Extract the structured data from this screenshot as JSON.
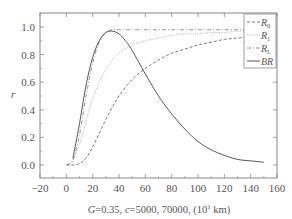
{
  "chart_data": {
    "type": "line",
    "title": "",
    "xlabel": "G=0.35, c=5000, 70000, (10¹ km)",
    "ylabel": "r",
    "xlim": [
      -20,
      160
    ],
    "ylim": [
      -0.1,
      1.1
    ],
    "x_ticks": [
      -20,
      0,
      20,
      40,
      60,
      80,
      100,
      120,
      140,
      160
    ],
    "y_ticks": [
      0.0,
      0.2,
      0.4,
      0.6,
      0.8,
      1.0
    ],
    "grid": false,
    "legend_position": "top-right",
    "series": [
      {
        "name": "R0",
        "label_main": "R",
        "label_sub": "0",
        "style": "dashed",
        "x": [
          0,
          5,
          10,
          15,
          20,
          25,
          30,
          35,
          40,
          50,
          60,
          70,
          80,
          90,
          100,
          110,
          120,
          130,
          140,
          150
        ],
        "values": [
          0.0,
          0.0,
          0.01,
          0.05,
          0.13,
          0.23,
          0.33,
          0.42,
          0.5,
          0.62,
          0.7,
          0.76,
          0.81,
          0.84,
          0.87,
          0.89,
          0.91,
          0.92,
          0.93,
          0.94
        ]
      },
      {
        "name": "R1",
        "label_main": "R",
        "label_sub": "1",
        "style": "dotted",
        "x": [
          2,
          5,
          10,
          15,
          20,
          25,
          30,
          35,
          40,
          50,
          60,
          70,
          80,
          90,
          100,
          110,
          120,
          130,
          140,
          150
        ],
        "values": [
          0.0,
          0.03,
          0.15,
          0.32,
          0.48,
          0.6,
          0.69,
          0.76,
          0.81,
          0.87,
          0.9,
          0.92,
          0.94,
          0.95,
          0.95,
          0.96,
          0.96,
          0.97,
          0.97,
          0.97
        ]
      },
      {
        "name": "RL",
        "label_main": "R",
        "label_sub": "L",
        "style": "dash-dot",
        "x": [
          0,
          5,
          10,
          15,
          20,
          25,
          30,
          35,
          40,
          50,
          60,
          80,
          100,
          120,
          150
        ],
        "values": [
          0.0,
          0.04,
          0.22,
          0.5,
          0.74,
          0.89,
          0.96,
          0.98,
          0.98,
          0.98,
          0.98,
          0.98,
          0.98,
          0.98,
          0.98
        ]
      },
      {
        "name": "BR",
        "label_main": "BR",
        "label_sub": "",
        "style": "solid",
        "x": [
          5,
          10,
          15,
          20,
          25,
          30,
          35,
          40,
          45,
          50,
          60,
          70,
          80,
          90,
          100,
          110,
          120,
          130,
          140,
          150
        ],
        "values": [
          0.05,
          0.3,
          0.58,
          0.78,
          0.9,
          0.96,
          0.97,
          0.95,
          0.9,
          0.83,
          0.66,
          0.5,
          0.37,
          0.26,
          0.17,
          0.11,
          0.07,
          0.04,
          0.03,
          0.02
        ]
      }
    ]
  },
  "legend": {
    "items": [
      {
        "main": "R",
        "sub": "0"
      },
      {
        "main": "R",
        "sub": "1"
      },
      {
        "main": "R",
        "sub": "L"
      },
      {
        "main": "BR",
        "sub": ""
      }
    ]
  },
  "axes": {
    "xlabel_prefix": "G",
    "xlabel_rest1": "=0.35, ",
    "xlabel_c": "c",
    "xlabel_rest2": "=5000, 70000, (10",
    "xlabel_sup": "1",
    "xlabel_rest3": " km)",
    "ylabel": "r",
    "x_tick_labels": [
      "−20",
      "0",
      "20",
      "40",
      "60",
      "80",
      "100",
      "120",
      "140",
      "160"
    ],
    "y_tick_labels": [
      "0.0",
      "0.2",
      "0.4",
      "0.6",
      "0.8",
      "1.0"
    ]
  },
  "colors": {
    "axis": "#777777",
    "line": "#555555",
    "text": "#555555"
  }
}
